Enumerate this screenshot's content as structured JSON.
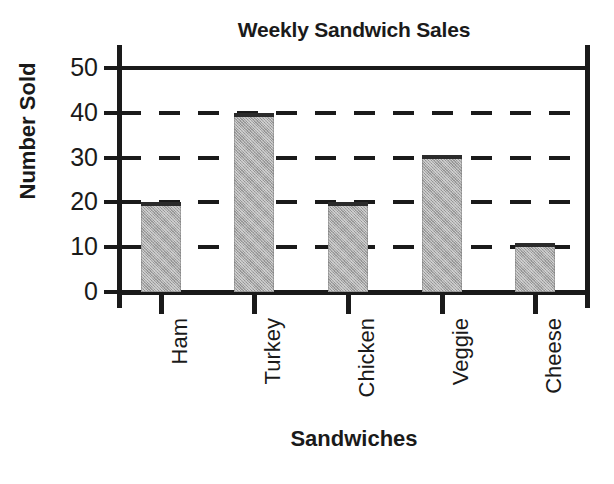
{
  "chart_data": {
    "type": "bar",
    "title": "Weekly Sandwich Sales",
    "xlabel": "Sandwiches",
    "ylabel": "Number Sold",
    "categories": [
      "Ham",
      "Turkey",
      "Chicken",
      "Veggie",
      "Cheese"
    ],
    "values": [
      20,
      40,
      20,
      30.5,
      11
    ],
    "ylim": [
      0,
      50
    ],
    "ytick_labels": [
      "50",
      "40",
      "30",
      "20",
      "10",
      "0"
    ],
    "ytick_values": [
      50,
      40,
      30,
      20,
      10,
      0
    ],
    "grid": "horizontal-dashed-with-solid-top",
    "gridlines": [
      {
        "value": 50,
        "style": "solid"
      },
      {
        "value": 40,
        "style": "dashed"
      },
      {
        "value": 30,
        "style": "dashed"
      },
      {
        "value": 20,
        "style": "dashed"
      },
      {
        "value": 10,
        "style": "dashed"
      }
    ],
    "legend": null,
    "legend_position": "none",
    "bar_fill_color": "#a9a9a9",
    "axis_color": "#1a1a1a",
    "background_color": "#ffffff",
    "bars": [
      {
        "label": "Ham",
        "value": 20
      },
      {
        "label": "Turkey",
        "value": 40
      },
      {
        "label": "Chicken",
        "value": 20
      },
      {
        "label": "Veggie",
        "value": 30.5
      },
      {
        "label": "Cheese",
        "value": 11
      }
    ]
  }
}
